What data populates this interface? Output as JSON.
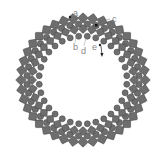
{
  "diagram": {
    "center": [
      83,
      80
    ],
    "colors": {
      "bead_fill": "#6e6e6e",
      "bead_stroke": "#4a4a4a",
      "bead_highlight": "#9a9a9a",
      "thread": "#222222",
      "label": "#888888"
    },
    "rows": [
      {
        "name": "outer-square-row",
        "shape": "square",
        "radius": 62,
        "count": 40,
        "size": 7.5,
        "offset": 0
      },
      {
        "name": "round-row-1",
        "shape": "round",
        "radius": 56,
        "count": 40,
        "size": 3.2,
        "offset": 4.5
      },
      {
        "name": "inner-square-row",
        "shape": "square",
        "radius": 51,
        "count": 36,
        "size": 6.5,
        "offset": 0
      },
      {
        "name": "round-row-2",
        "shape": "round",
        "radius": 44,
        "count": 32,
        "size": 3.0,
        "offset": 5.6
      }
    ],
    "labels": [
      {
        "text": "a",
        "x": 73,
        "y": 16
      },
      {
        "text": "b",
        "x": 73,
        "y": 50
      },
      {
        "text": "c",
        "x": 112,
        "y": 22
      },
      {
        "text": "d",
        "x": 81,
        "y": 54
      },
      {
        "text": "e",
        "x": 92,
        "y": 50
      }
    ]
  }
}
